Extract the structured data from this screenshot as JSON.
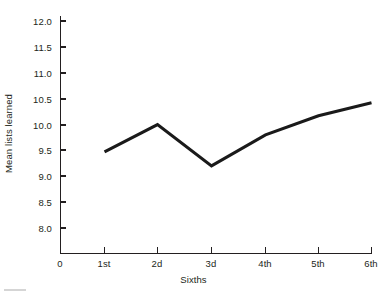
{
  "chart_data": {
    "type": "line",
    "title": "",
    "subtitle": "",
    "xlabel": "Sixths",
    "ylabel": "Mean lists learned",
    "categories": [
      "1st",
      "2d",
      "3d",
      "4th",
      "5th",
      "6th"
    ],
    "x_tick_labels": [
      "0",
      "1st",
      "2d",
      "3d",
      "4th",
      "5th",
      "6th"
    ],
    "y_tick_labels": [
      "8.0",
      "8.5",
      "9.0",
      "9.5",
      "10.0",
      "10.5",
      "11.0",
      "11.5",
      "12.0"
    ],
    "y_tick_values": [
      8.0,
      8.5,
      9.0,
      9.5,
      10.0,
      10.5,
      11.0,
      11.5,
      12.0
    ],
    "ylim": [
      8.0,
      12.0
    ],
    "xlim": [
      0,
      6
    ],
    "axis_break_label": "0",
    "grid": false,
    "legend": null,
    "series": [
      {
        "name": "Mean lists learned",
        "color": "#1a1a1a",
        "values": [
          9.47,
          10.0,
          9.2,
          9.8,
          10.17,
          10.42
        ]
      }
    ]
  },
  "figure": {
    "background_color": "#ffffff",
    "axis_color": "#231f20",
    "line_color": "#1a1a1a"
  }
}
